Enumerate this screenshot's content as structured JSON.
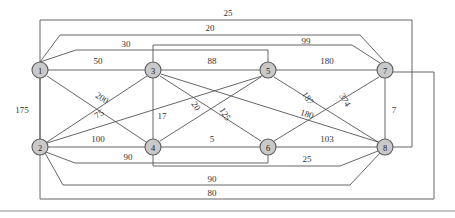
{
  "figure": {
    "type": "node-link-diagram",
    "width": 455,
    "height": 218,
    "background_color": "#ffffff",
    "node_fill_color": "#c9c9c9",
    "node_stroke_color": "#5a5a5a",
    "edge_color": "#555555",
    "label_color": "#333333"
  },
  "nodes": [
    {
      "id": "1",
      "label": "1",
      "x": 40,
      "y": 70,
      "r": 8
    },
    {
      "id": "2",
      "label": "2",
      "x": 40,
      "y": 147,
      "r": 8
    },
    {
      "id": "3",
      "label": "3",
      "x": 153,
      "y": 70,
      "r": 8
    },
    {
      "id": "4",
      "label": "4",
      "x": 153,
      "y": 147,
      "r": 8
    },
    {
      "id": "5",
      "label": "5",
      "x": 268,
      "y": 70,
      "r": 8
    },
    {
      "id": "6",
      "label": "6",
      "x": 268,
      "y": 147,
      "r": 8
    },
    {
      "id": "7",
      "label": "7",
      "x": 385,
      "y": 70,
      "r": 8
    },
    {
      "id": "8",
      "label": "8",
      "x": 385,
      "y": 147,
      "r": 8
    }
  ],
  "edges": [
    {
      "id": "e-1-8",
      "source": "1",
      "target": "8",
      "weight": "25",
      "path": "M 40 62 L 40 20 L 412 20 L 412 147 L 393 147",
      "label_x": 228,
      "label_y": 13,
      "routing": "orthogonal-top"
    },
    {
      "id": "e-1-7",
      "source": "1",
      "target": "7",
      "weight": "20",
      "path": "M 40 62 L 60 35 L 360 35 L 385 62",
      "label_x": 210,
      "label_y": 28,
      "routing": "trapezoid-top"
    },
    {
      "id": "e-1-5",
      "source": "1",
      "target": "5",
      "weight": "30",
      "path": "M 40 62 L 76 50 L 268 50 L 268 62",
      "label_x": 126,
      "label_y": 44,
      "routing": "step-top"
    },
    {
      "id": "e-1-3",
      "source": "1",
      "target": "3",
      "weight": "50",
      "path": "M 48 70 L 145 70",
      "label_x": 98,
      "label_y": 61,
      "routing": "straight"
    },
    {
      "id": "e-1-4",
      "source": "1",
      "target": "4",
      "weight": "200",
      "path": "M 47 76 L 146 142",
      "label_x": 102,
      "label_y": 98,
      "routing": "straight",
      "rotate": 33
    },
    {
      "id": "e-1-2",
      "source": "1",
      "target": "2",
      "weight": "175",
      "path": "M 40 78 L 40 139",
      "label_x": 22,
      "label_y": 110,
      "routing": "vertical"
    },
    {
      "id": "e-3-5",
      "source": "3",
      "target": "5",
      "weight": "88",
      "path": "M 161 70 L 260 70",
      "label_x": 212,
      "label_y": 61,
      "routing": "straight"
    },
    {
      "id": "e-3-7",
      "source": "3",
      "target": "7",
      "weight": "99",
      "path": "M 153 62 L 153 45 L 352 45 L 380 63",
      "label_x": 306,
      "label_y": 41,
      "routing": "step-top"
    },
    {
      "id": "e-5-7",
      "source": "5",
      "target": "7",
      "weight": "180",
      "path": "M 276 70 L 377 70",
      "label_x": 327,
      "label_y": 61,
      "routing": "straight"
    },
    {
      "id": "e-5-8",
      "source": "5",
      "target": "8",
      "weight": "187",
      "path": "M 274 77 L 378 142",
      "label_x": 308,
      "label_y": 98,
      "routing": "straight",
      "rotate": 57
    },
    {
      "id": "e-6-7",
      "source": "6",
      "target": "7",
      "weight": "374",
      "path": "M 274 141 L 379 77",
      "label_x": 345,
      "label_y": 100,
      "routing": "straight",
      "rotate": 58
    },
    {
      "id": "e-7-8",
      "source": "7",
      "target": "8",
      "weight": "7",
      "path": "M 385 78 L 385 139",
      "label_x": 394,
      "label_y": 110,
      "routing": "vertical"
    },
    {
      "id": "e-2-3",
      "source": "2",
      "target": "3",
      "weight": "75",
      "path": "M 47 142 L 147 76",
      "label_x": 99,
      "label_y": 114,
      "routing": "straight",
      "rotate": -33
    },
    {
      "id": "e-2-4",
      "source": "2",
      "target": "4",
      "weight": "100",
      "path": "M 48 147 L 145 147",
      "label_x": 98,
      "label_y": 139,
      "routing": "straight"
    },
    {
      "id": "e-3-4",
      "source": "3",
      "target": "4",
      "weight": "17",
      "path": "M 153 78 L 153 139",
      "label_x": 162,
      "label_y": 116,
      "routing": "vertical"
    },
    {
      "id": "e-3-6",
      "source": "3",
      "target": "6",
      "weight": "20",
      "path": "M 160 76 L 261 141",
      "label_x": 196,
      "label_y": 106,
      "routing": "straight",
      "rotate": 58
    },
    {
      "id": "e-4-5",
      "source": "4",
      "target": "5",
      "weight": "125",
      "path": "M 160 141 L 261 77",
      "label_x": 225,
      "label_y": 114,
      "routing": "straight",
      "rotate": 58
    },
    {
      "id": "e-4-6",
      "source": "4",
      "target": "6",
      "weight": "5",
      "path": "M 161 147 L 260 147",
      "label_x": 212,
      "label_y": 139,
      "routing": "straight"
    },
    {
      "id": "e-3-8",
      "source": "3",
      "target": "8",
      "weight": "180",
      "path": "M 161 74 L 378 142",
      "label_x": 307,
      "label_y": 114,
      "routing": "straight",
      "rotate": 18
    },
    {
      "id": "e-5-4b",
      "source": "5",
      "target": "2",
      "weight": "",
      "path": "M 262 76 L 47 143",
      "label_x": 0,
      "label_y": 0,
      "routing": "straight"
    },
    {
      "id": "e-6-8",
      "source": "6",
      "target": "8",
      "weight": "103",
      "path": "M 276 147 L 377 147",
      "label_x": 327,
      "label_y": 139,
      "routing": "straight"
    },
    {
      "id": "e-4-8",
      "source": "4",
      "target": "8",
      "weight": "25",
      "path": "M 153 155 L 153 166 L 340 166 L 378 151",
      "label_x": 307,
      "label_y": 159,
      "routing": "step-bottom"
    },
    {
      "id": "e-2-6",
      "source": "2",
      "target": "6",
      "weight": "90",
      "path": "M 46 152 L 75 163 L 268 163 L 268 155",
      "label_x": 128,
      "label_y": 157,
      "routing": "step-bottom"
    },
    {
      "id": "e-2-8",
      "source": "2",
      "target": "8",
      "weight": "90",
      "path": "M 45 153 L 63 185 L 350 185 L 380 153",
      "label_x": 212,
      "label_y": 179,
      "routing": "trapezoid-bottom"
    },
    {
      "id": "e-1-7b",
      "source": "1",
      "target": "7",
      "weight": "80",
      "path": "M 40 78 L 40 199 L 434 199 L 434 72 L 393 72",
      "label_x": 212,
      "label_y": 193,
      "routing": "orthogonal-bottom"
    }
  ],
  "footer": {
    "rule_label": "horizontal-rule",
    "rule_y": 211
  }
}
